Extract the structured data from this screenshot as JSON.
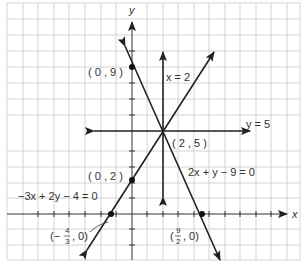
{
  "diagram": {
    "axes": {
      "x_label": "x",
      "y_label": "y"
    },
    "grid": {
      "unit_px": 15.5,
      "origin_px": [
        132,
        214
      ]
    },
    "lines": [
      {
        "equation": "2x + y - 9 = 0",
        "label": "2x + y − 9 = 0"
      },
      {
        "equation": "-3x + 2y - 4 = 0",
        "label": "−3x + 2y − 4 = 0"
      },
      {
        "equation": "x = 2",
        "label": "x = 2"
      },
      {
        "equation": "y = 5",
        "label": "y = 5"
      }
    ],
    "points": [
      {
        "label": "( 0 , 9 )"
      },
      {
        "label": "( 0 , 2 )"
      },
      {
        "label": "( 2 , 5 )"
      },
      {
        "label_prefix": "(−",
        "num": "4",
        "den": "3",
        "label_suffix": ", 0)"
      },
      {
        "label_prefix": "(",
        "num": "9",
        "den": "2",
        "label_suffix": ", 0)"
      }
    ]
  }
}
